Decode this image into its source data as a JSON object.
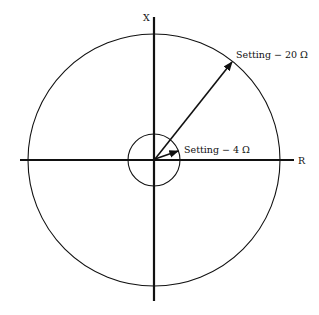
{
  "diagram": {
    "axes": {
      "horizontal_label": "R",
      "vertical_label": "X"
    },
    "outer_circle": {
      "label": "Setting − 20 Ω",
      "setting_ohms": 20
    },
    "inner_circle": {
      "label": "Setting − 4 Ω",
      "setting_ohms": 4
    },
    "colors": {
      "stroke": "#111111",
      "background": "#ffffff"
    }
  }
}
